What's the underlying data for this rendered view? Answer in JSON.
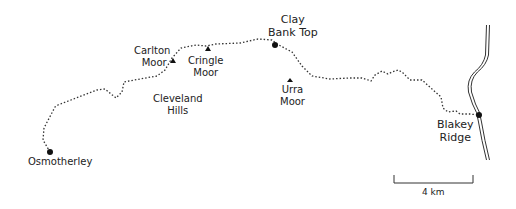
{
  "map": {
    "places": {
      "osmotherley": "Osmotherley",
      "carlton_moor_1": "Carlton",
      "carlton_moor_2": "Moor",
      "cringle_moor_1": "Cringle",
      "cringle_moor_2": "Moor",
      "clay_bank_top_1": "Clay",
      "clay_bank_top_2": "Bank Top",
      "urra_moor_1": "Urra",
      "urra_moor_2": "Moor",
      "cleveland_hills_1": "Cleveland",
      "cleveland_hills_2": "Hills",
      "blakey_ridge_1": "Blakey",
      "blakey_ridge_2": "Ridge"
    },
    "scale_bar": {
      "label": "4 km"
    },
    "colors": {
      "ink": "#222222",
      "background": "#ffffff"
    }
  }
}
